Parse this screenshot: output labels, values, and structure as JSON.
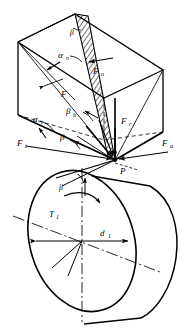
{
  "figure": {
    "stroke_color": "#000000",
    "background_color": "#ffffff",
    "hatch_color": "#000000"
  },
  "labels": {
    "beta_apex": "β",
    "alpha_n": "α",
    "alpha_n_sub": "n",
    "F_n": "F",
    "F_n_sub": "n",
    "F_plain": "F",
    "beta_b": "β",
    "beta_b_sub": "b",
    "alpha_t": "α",
    "alpha_t_sub": "t",
    "F_t": "F",
    "F_t_sub": "t",
    "beta_mid": "β",
    "F_r": "F",
    "F_r_sub": "r",
    "F_a": "F",
    "F_a_sub": "a",
    "point_P": "P",
    "beta_lower": "β",
    "T_1": "T",
    "T_1_sub": "1",
    "d_1": "d",
    "d_1_sub": "1"
  },
  "geometry": {
    "point_P": {
      "x": 115,
      "y": 160
    },
    "apex_top": {
      "x": 75,
      "y": 14
    },
    "box_front_bottom_left": {
      "x": 18,
      "y": 115
    },
    "box_front_top_left": {
      "x": 18,
      "y": 42
    },
    "box_right_edge_x": 163,
    "cylinder_center": {
      "x": 82,
      "y": 241
    },
    "cylinder_diameter_label_value": "d1"
  }
}
